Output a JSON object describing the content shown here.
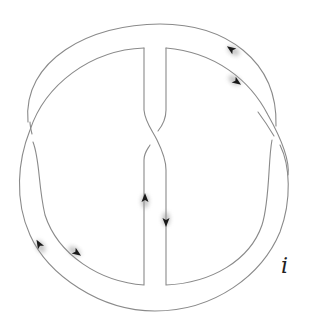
{
  "figure": {
    "type": "knot-diagram",
    "label": "i",
    "stroke_color": "#8a8a8a",
    "arrow_color": "#1a1a1a",
    "background": "#ffffff",
    "crossings": 3,
    "arrows": [
      {
        "id": "top-outer",
        "direction": "up-left"
      },
      {
        "id": "top-inner",
        "direction": "down-right"
      },
      {
        "id": "center-left",
        "direction": "up"
      },
      {
        "id": "center-right",
        "direction": "down"
      },
      {
        "id": "bottom-outer-left",
        "direction": "up-left"
      },
      {
        "id": "bottom-inner-left",
        "direction": "down-right"
      }
    ]
  }
}
